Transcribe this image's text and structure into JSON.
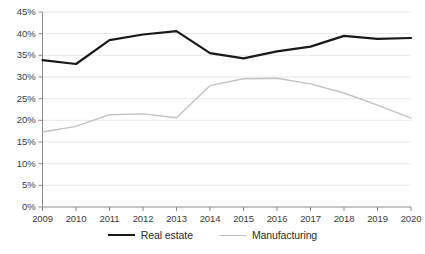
{
  "chart_data": {
    "type": "line",
    "title": "",
    "xlabel": "",
    "ylabel": "",
    "categories": [
      "2009",
      "2010",
      "2011",
      "2012",
      "2013",
      "2014",
      "2015",
      "2016",
      "2017",
      "2018",
      "2019",
      "2020"
    ],
    "ylim": [
      0,
      45
    ],
    "ytick_labels": [
      "0%",
      "5%",
      "10%",
      "15%",
      "20%",
      "25%",
      "30%",
      "35%",
      "40%",
      "45%"
    ],
    "ytick_values": [
      0,
      5,
      10,
      15,
      20,
      25,
      30,
      35,
      40,
      45
    ],
    "grid": true,
    "legend_position": "bottom",
    "series": [
      {
        "name": "Real estate",
        "color": "#1a1a1a",
        "width": 2.2,
        "values": [
          33.9,
          33.0,
          38.5,
          39.8,
          40.6,
          35.5,
          34.3,
          35.9,
          37.0,
          39.5,
          38.8,
          39.0
        ]
      },
      {
        "name": "Manufacturing",
        "color": "#c2c2c2",
        "width": 1.4,
        "values": [
          17.3,
          18.6,
          21.3,
          21.5,
          20.6,
          28.0,
          29.6,
          29.7,
          28.4,
          26.3,
          23.5,
          20.5
        ]
      }
    ]
  },
  "axis": {
    "axis_color": "#8c8c8c",
    "grid_color": "#e8e8e8"
  }
}
